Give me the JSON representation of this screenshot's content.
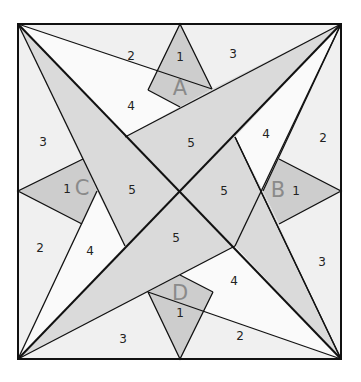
{
  "diagram": {
    "colors": {
      "light": "#f0f0f0",
      "white": "#fbfbfb",
      "gray": "#dcdcdc",
      "kite": "#cfcfcf",
      "line": "#111111",
      "letter": "#8a8a8a"
    },
    "kites": [
      {
        "letter": "A",
        "piece": "1"
      },
      {
        "letter": "B",
        "piece": "1"
      },
      {
        "letter": "C",
        "piece": "1"
      },
      {
        "letter": "D",
        "piece": "1"
      }
    ],
    "labels": {
      "a1": "1",
      "a_top_left_2": "2",
      "a_top_right_3": "3",
      "a_4": "4",
      "a_5": "5",
      "b1": "1",
      "b_2": "2",
      "b_4": "4",
      "b_5": "5",
      "b_3": "3",
      "c1": "1",
      "c_3": "3",
      "c_2": "2",
      "c_4": "4",
      "c_5": "5",
      "d1": "1",
      "d_3": "3",
      "d_2": "2",
      "d_4": "4",
      "d_5": "5"
    },
    "letters": {
      "a": "A",
      "b": "B",
      "c": "C",
      "d": "D"
    }
  }
}
